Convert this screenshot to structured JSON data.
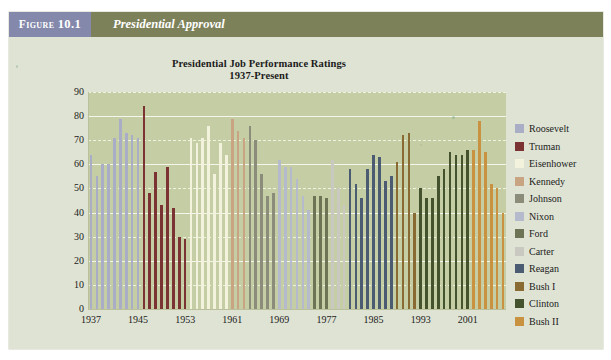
{
  "figure": {
    "tab_label_prefix": "Figure",
    "tab_number": "10.1",
    "header_title": "Presidential Approval"
  },
  "chart_colors": {
    "plot_background": "#c5cda4",
    "card_background": "#dfe3d4",
    "header_band": "#7d8159",
    "header_tab": "#8489ac",
    "gridline": "#f4f6ec",
    "axis_text": "#1b1b1b"
  },
  "chart_data": {
    "type": "bar",
    "title": "Presidential Job Performance Ratings",
    "subtitle": "1937-Present",
    "xlabel": "",
    "ylabel": "",
    "ylim": [
      0,
      90
    ],
    "yticks": [
      0,
      10,
      20,
      30,
      40,
      50,
      60,
      70,
      80,
      90
    ],
    "xticks": [
      "1937",
      "1945",
      "1953",
      "1961",
      "1969",
      "1977",
      "1985",
      "1993",
      "2001"
    ],
    "grid": true,
    "legend_position": "right",
    "series": [
      {
        "name": "Roosevelt",
        "color": "#a9aec6",
        "values": [
          64,
          55,
          60,
          60,
          71,
          79,
          73,
          72,
          71
        ]
      },
      {
        "name": "Truman",
        "color": "#7a3332",
        "values": [
          84,
          48,
          57,
          43,
          59,
          42,
          30,
          29
        ]
      },
      {
        "name": "Eisenhower",
        "color": "#f2f2dd",
        "values": [
          71,
          69,
          71,
          76,
          56,
          69,
          64
        ]
      },
      {
        "name": "Kennedy",
        "color": "#c9a483",
        "values": [
          79,
          74,
          71
        ]
      },
      {
        "name": "Johnson",
        "color": "#8c8c7b",
        "values": [
          76,
          70,
          56,
          47,
          48
        ]
      },
      {
        "name": "Nixon",
        "color": "#b5bacd",
        "values": [
          62,
          59,
          59,
          54,
          47,
          41
        ]
      },
      {
        "name": "Ford",
        "color": "#6d7355",
        "values": [
          47,
          47,
          46
        ]
      },
      {
        "name": "Carter",
        "color": "#c9c9c1",
        "values": [
          62,
          50,
          43
        ]
      },
      {
        "name": "Reagan",
        "color": "#4b5b71",
        "values": [
          58,
          52,
          46,
          58,
          64,
          63,
          53,
          55
        ]
      },
      {
        "name": "Bush I",
        "color": "#8a6a33",
        "values": [
          61,
          72,
          73,
          40
        ]
      },
      {
        "name": "Clinton",
        "color": "#44522e",
        "values": [
          50,
          46,
          46,
          55,
          58,
          65,
          64,
          64,
          66
        ]
      },
      {
        "name": "Bush II",
        "color": "#c99240",
        "values": [
          66,
          78,
          65,
          52,
          50,
          40
        ]
      }
    ]
  }
}
